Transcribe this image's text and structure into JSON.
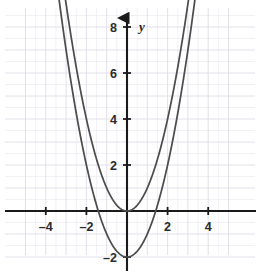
{
  "chart_data": {
    "type": "line",
    "title": "",
    "subtitle": "",
    "xlabel": "",
    "ylabel": "y",
    "xlim": [
      -5.4,
      5.4
    ],
    "ylim": [
      -2.9,
      8.6
    ],
    "grid": true,
    "minor_grid": true,
    "grid_step": 0.5,
    "major_grid_step": 1,
    "legend": "none",
    "x_ticks": [
      -4,
      -2,
      2,
      4
    ],
    "x_tick_labels": [
      "–4",
      "–2",
      "2",
      "4"
    ],
    "y_ticks": [
      -2,
      2,
      4,
      6,
      8
    ],
    "y_tick_labels": [
      "–2",
      "2",
      "4",
      "6",
      "8"
    ],
    "annotations": [],
    "series": [
      {
        "name": "y = x^2",
        "equation": "y = x^2",
        "vertex": [
          0,
          0
        ],
        "a": 1,
        "h": 0,
        "k": 0,
        "color": "#4d4d4d",
        "points": [
          [
            -2.95,
            8.7
          ],
          [
            -2.8,
            7.84
          ],
          [
            -2.6,
            6.76
          ],
          [
            -2.4,
            5.76
          ],
          [
            -2.2,
            4.84
          ],
          [
            -2.0,
            4.0
          ],
          [
            -1.8,
            3.24
          ],
          [
            -1.6,
            2.56
          ],
          [
            -1.4,
            1.96
          ],
          [
            -1.2,
            1.44
          ],
          [
            -1.0,
            1.0
          ],
          [
            -0.8,
            0.64
          ],
          [
            -0.6,
            0.36
          ],
          [
            -0.4,
            0.16
          ],
          [
            -0.2,
            0.04
          ],
          [
            0.0,
            0.0
          ],
          [
            0.2,
            0.04
          ],
          [
            0.4,
            0.16
          ],
          [
            0.6,
            0.36
          ],
          [
            0.8,
            0.64
          ],
          [
            1.0,
            1.0
          ],
          [
            1.2,
            1.44
          ],
          [
            1.4,
            1.96
          ],
          [
            1.6,
            2.56
          ],
          [
            1.8,
            3.24
          ],
          [
            2.0,
            4.0
          ],
          [
            2.2,
            4.84
          ],
          [
            2.4,
            5.76
          ],
          [
            2.6,
            6.76
          ],
          [
            2.8,
            7.84
          ],
          [
            2.95,
            8.7
          ]
        ]
      },
      {
        "name": "y = x^2 - 2",
        "equation": "y = x^2 – 2",
        "vertex": [
          0,
          -2
        ],
        "a": 1,
        "h": 0,
        "k": -2,
        "color": "#4d4d4d",
        "x_intercepts": [
          -1.41,
          1.41
        ],
        "points": [
          [
            -3.28,
            8.76
          ],
          [
            -3.1,
            7.61
          ],
          [
            -2.9,
            6.41
          ],
          [
            -2.7,
            5.29
          ],
          [
            -2.5,
            4.25
          ],
          [
            -2.3,
            3.29
          ],
          [
            -2.1,
            2.41
          ],
          [
            -1.9,
            1.61
          ],
          [
            -1.7,
            0.89
          ],
          [
            -1.5,
            0.25
          ],
          [
            -1.3,
            -0.31
          ],
          [
            -1.1,
            -0.79
          ],
          [
            -0.9,
            -1.19
          ],
          [
            -0.7,
            -1.51
          ],
          [
            -0.5,
            -1.75
          ],
          [
            -0.3,
            -1.91
          ],
          [
            -0.1,
            -1.99
          ],
          [
            0.0,
            -2.0
          ],
          [
            0.1,
            -1.99
          ],
          [
            0.3,
            -1.91
          ],
          [
            0.5,
            -1.75
          ],
          [
            0.7,
            -1.51
          ],
          [
            0.9,
            -1.19
          ],
          [
            1.1,
            -0.79
          ],
          [
            1.3,
            -0.31
          ],
          [
            1.5,
            0.25
          ],
          [
            1.7,
            0.89
          ],
          [
            1.9,
            1.61
          ],
          [
            2.1,
            2.41
          ],
          [
            2.3,
            3.29
          ],
          [
            2.5,
            4.25
          ],
          [
            2.7,
            5.29
          ],
          [
            2.9,
            6.41
          ],
          [
            3.1,
            7.61
          ],
          [
            3.28,
            8.76
          ]
        ]
      }
    ]
  },
  "axes": {
    "y_axis_name": "y",
    "x_axis_name": ""
  },
  "colors": {
    "curve": "#4d4d4d",
    "axis": "#1a1a1a",
    "grid_minor": "#e9e6ee",
    "grid_major": "#dedae6",
    "tick_text": "#2b2b2b",
    "background": "#ffffff"
  },
  "geometry": {
    "origin_px": [
      127,
      211
    ],
    "unit_x_px": 20.3,
    "unit_y_px": 23.0
  }
}
